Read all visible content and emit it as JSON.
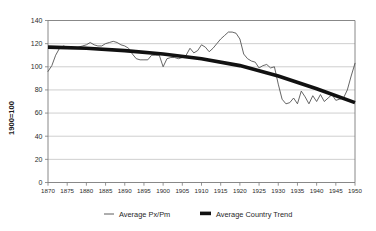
{
  "chart_data": {
    "type": "line",
    "title": "",
    "xlabel": "",
    "ylabel": "1900=100",
    "xlim": [
      1870,
      1950
    ],
    "ylim": [
      0,
      140
    ],
    "ytick_step": 20,
    "xtick_step": 5,
    "grid": true,
    "legend_position": "bottom",
    "yticks": [
      "0",
      "20",
      "40",
      "60",
      "80",
      "100",
      "120",
      "140"
    ],
    "xticks": [
      "1870",
      "1875",
      "1880",
      "1885",
      "1890",
      "1895",
      "1900",
      "1905",
      "1910",
      "1915",
      "1920",
      "1925",
      "1930",
      "1935",
      "1940",
      "1945",
      "1950"
    ],
    "series": [
      {
        "name": "Average Px/Pm",
        "style": "thin-line",
        "color": "#4a4a4a",
        "x": [
          1870,
          1871,
          1872,
          1873,
          1874,
          1875,
          1876,
          1877,
          1878,
          1879,
          1880,
          1881,
          1882,
          1883,
          1884,
          1885,
          1886,
          1887,
          1888,
          1889,
          1890,
          1891,
          1892,
          1893,
          1894,
          1895,
          1896,
          1897,
          1898,
          1899,
          1900,
          1901,
          1902,
          1903,
          1904,
          1905,
          1906,
          1907,
          1908,
          1909,
          1910,
          1911,
          1912,
          1913,
          1914,
          1915,
          1916,
          1917,
          1918,
          1919,
          1920,
          1921,
          1922,
          1923,
          1924,
          1925,
          1926,
          1927,
          1928,
          1929,
          1930,
          1931,
          1932,
          1933,
          1934,
          1935,
          1936,
          1937,
          1938,
          1939,
          1940,
          1941,
          1942,
          1943,
          1944,
          1945,
          1946,
          1947,
          1948,
          1949,
          1950
        ],
        "values": [
          96,
          101,
          110,
          116,
          118,
          117,
          116,
          116,
          117,
          118,
          119,
          121,
          119,
          118,
          118,
          120,
          121,
          122,
          121,
          119,
          118,
          116,
          111,
          107,
          106,
          106,
          106,
          110,
          110,
          110,
          100,
          107,
          108,
          108,
          107,
          108,
          110,
          116,
          112,
          114,
          119,
          117,
          113,
          116,
          120,
          124,
          127,
          130,
          130,
          129,
          124,
          111,
          107,
          105,
          104,
          99,
          101,
          102,
          99,
          100,
          85,
          72,
          68,
          69,
          73,
          68,
          79,
          74,
          68,
          75,
          70,
          76,
          70,
          73,
          76,
          71,
          72,
          73,
          80,
          92,
          103
        ]
      },
      {
        "name": "Average Country Trend",
        "style": "thick-line",
        "color": "#111111",
        "x": [
          1870,
          1880,
          1890,
          1900,
          1910,
          1920,
          1930,
          1940,
          1950
        ],
        "values": [
          117,
          116,
          114,
          111,
          107,
          101,
          92,
          81,
          69
        ]
      }
    ],
    "legend": [
      {
        "label": "Average Px/Pm",
        "marker": "thin-line",
        "color": "#4a4a4a"
      },
      {
        "label": "Average Country Trend",
        "marker": "thick-line",
        "color": "#111111"
      }
    ]
  }
}
